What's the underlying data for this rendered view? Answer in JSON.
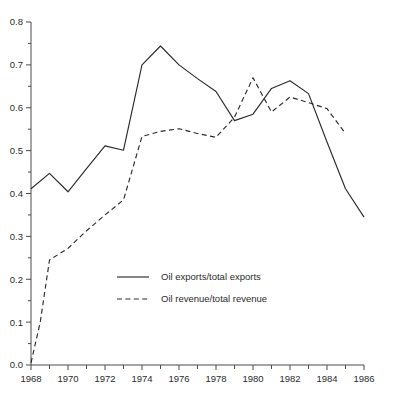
{
  "chart_data": {
    "type": "line",
    "title": "",
    "subtitle": "",
    "xlabel": "",
    "ylabel": "",
    "xlim": [
      1968,
      1986
    ],
    "ylim": [
      0.0,
      0.8
    ],
    "grid": false,
    "legend_position": "center-lower",
    "x_tick_labels": [
      "1968",
      "1970",
      "1972",
      "1974",
      "1976",
      "1978",
      "1980",
      "1982",
      "1984",
      "1986"
    ],
    "x_tick_values": [
      1968,
      1970,
      1972,
      1974,
      1976,
      1978,
      1980,
      1982,
      1984,
      1986
    ],
    "x_minor_ticks": [
      1969,
      1971,
      1973,
      1975,
      1977,
      1979,
      1981,
      1983,
      1985
    ],
    "y_tick_labels": [
      "0.0",
      "0.1",
      "0.2",
      "0.3",
      "0.4",
      "0.5",
      "0.6",
      "0.7",
      "0.8"
    ],
    "y_tick_values": [
      0.0,
      0.1,
      0.2,
      0.3,
      0.4,
      0.5,
      0.6,
      0.7,
      0.8
    ],
    "series": [
      {
        "name": "Oil exports/total exports",
        "style": "solid",
        "color": "#2b2b2b",
        "x": [
          1968,
          1969,
          1970,
          1971,
          1972,
          1973,
          1974,
          1975,
          1976,
          1977,
          1978,
          1979,
          1980,
          1981,
          1982,
          1983,
          1984,
          1985,
          1986
        ],
        "values": [
          0.411,
          0.447,
          0.404,
          0.458,
          0.511,
          0.501,
          0.7,
          0.744,
          0.7,
          0.668,
          0.638,
          0.57,
          0.585,
          0.645,
          0.663,
          0.633,
          0.52,
          0.411,
          0.345
        ]
      },
      {
        "name": "Oil revenue/total revenue",
        "style": "dashed",
        "color": "#2b2b2b",
        "x": [
          1968,
          1968.5,
          1969,
          1970,
          1971,
          1972,
          1973,
          1974,
          1975,
          1976,
          1977,
          1978,
          1979,
          1980,
          1981,
          1982,
          1983,
          1984,
          1985
        ],
        "values": [
          0.005,
          0.1,
          0.245,
          0.272,
          0.313,
          0.35,
          0.385,
          0.533,
          0.545,
          0.551,
          0.54,
          0.531,
          0.578,
          0.67,
          0.59,
          0.625,
          0.612,
          0.598,
          0.54
        ]
      }
    ]
  },
  "legend": {
    "entries": [
      {
        "label": "Oil exports/total exports",
        "style": "solid"
      },
      {
        "label": "Oil revenue/total revenue",
        "style": "dashed"
      }
    ]
  },
  "colors": {
    "line": "#2b2b2b",
    "axis": "#4a4a4a",
    "text": "#2b2b2b",
    "background": "#ffffff"
  }
}
